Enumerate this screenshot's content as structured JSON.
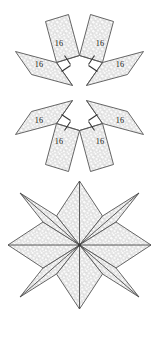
{
  "figure": {
    "background_color": "#ffffff",
    "fill_color": "#dedede",
    "stroke_color": "#4a4a4a",
    "texture": "speckled-dot-pattern",
    "side_length_label": "16"
  },
  "top_group": {
    "name": "four-congruent-pieces",
    "description": "Four congruent chevron pieces arranged around a center, each formed from two rhombi",
    "pieces": [
      {
        "id": "piece-top-left",
        "position": "top-left",
        "rotation_deg": 0,
        "labels": [
          "16",
          "16"
        ],
        "tick_marks": 2
      },
      {
        "id": "piece-top-right",
        "position": "top-right",
        "rotation_deg": 90,
        "labels": [
          "16",
          "16"
        ],
        "tick_marks": 2
      },
      {
        "id": "piece-bottom-left",
        "position": "bottom-left",
        "rotation_deg": 270,
        "labels": [
          "16",
          "16"
        ],
        "tick_marks": 2
      },
      {
        "id": "piece-bottom-right",
        "position": "bottom-right",
        "rotation_deg": 180,
        "labels": [
          "16",
          "16"
        ],
        "tick_marks": 2
      }
    ]
  },
  "bottom_group": {
    "name": "assembled-star",
    "description": "Eight-pointed star assembled from the four pieces",
    "point_count": 8,
    "rhombus_count": 8,
    "labels": []
  },
  "labels": {
    "tl_a": "16",
    "tl_b": "16",
    "tr_a": "16",
    "tr_b": "16",
    "bl_a": "16",
    "bl_b": "16",
    "br_a": "16",
    "br_b": "16"
  }
}
